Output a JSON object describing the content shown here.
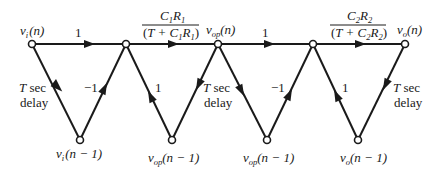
{
  "diagram": {
    "type": "signal-flow-graph",
    "nodes": [
      {
        "id": "vi_n",
        "label": "v_i(n)",
        "v": "v",
        "sub": "i",
        "arg": "(n)",
        "x": 32,
        "y": 44
      },
      {
        "id": "A",
        "label": "",
        "x": 126,
        "y": 44
      },
      {
        "id": "vop_n",
        "label": "v_op(n)",
        "v": "v",
        "sub": "op",
        "arg": "(n)",
        "x": 218,
        "y": 44
      },
      {
        "id": "B",
        "label": "",
        "x": 313,
        "y": 44
      },
      {
        "id": "vo_n",
        "label": "v_o(n)",
        "v": "v",
        "sub": "o",
        "arg": "(n)",
        "x": 405,
        "y": 44
      },
      {
        "id": "vi_n1",
        "label": "v_i(n−1)",
        "v": "v",
        "sub": "i",
        "arg": "(n − 1)",
        "x": 80,
        "y": 140
      },
      {
        "id": "vop_n1a",
        "label": "v_op(n−1)",
        "v": "v",
        "sub": "op",
        "arg": "(n − 1)",
        "x": 172,
        "y": 140
      },
      {
        "id": "vop_n1b",
        "label": "v_op(n−1)",
        "v": "v",
        "sub": "op",
        "arg": "(n − 1)",
        "x": 267,
        "y": 140
      },
      {
        "id": "vo_n1",
        "label": "v_o(n−1)",
        "v": "v",
        "sub": "o",
        "arg": "(n − 1)",
        "x": 358,
        "y": 140
      }
    ],
    "edges": [
      {
        "from": "vi_n",
        "to": "A",
        "gain": "1"
      },
      {
        "from": "A",
        "to": "vop_n",
        "gain": "C1R1/(T + C1R1)"
      },
      {
        "from": "vop_n",
        "to": "B",
        "gain": "1"
      },
      {
        "from": "B",
        "to": "vo_n",
        "gain": "C2R2/(T + C2R2)"
      },
      {
        "from": "vi_n",
        "to": "vi_n1",
        "gain": "T sec delay"
      },
      {
        "from": "vi_n1",
        "to": "A",
        "gain": "−1"
      },
      {
        "from": "vop_n1a",
        "to": "A",
        "gain": "1"
      },
      {
        "from": "vop_n",
        "to": "vop_n1a",
        "gain": "T sec delay"
      },
      {
        "from": "vop_n",
        "to": "vop_n1b",
        "gain": ""
      },
      {
        "from": "vop_n1b",
        "to": "B",
        "gain": "−1"
      },
      {
        "from": "vo_n1",
        "to": "B",
        "gain": "1"
      },
      {
        "from": "vo_n",
        "to": "vo_n1",
        "gain": "T sec delay"
      }
    ]
  },
  "labels": {
    "gain_one": "1",
    "gain_neg_one": "−1",
    "delay_T": "T",
    "delay_sec": " sec",
    "delay_word": "delay",
    "frac1": {
      "num_c": "C",
      "num_c_sub": "1",
      "num_r": "R",
      "num_r_sub": "1",
      "den_open": "(",
      "den_T": "T",
      "den_plus": " + C",
      "den_c_sub": "1",
      "den_r": "R",
      "den_r_sub": "1",
      "den_close": ")"
    },
    "frac2": {
      "num_c": "C",
      "num_c_sub": "2",
      "num_r": "R",
      "num_r_sub": "2",
      "den_open": "(",
      "den_T": "T",
      "den_plus": " + C",
      "den_c_sub": "2",
      "den_r": "R",
      "den_r_sub": "2",
      "den_close": ")"
    },
    "v": "v",
    "sub_i": "i",
    "sub_op": "op",
    "sub_o": "o",
    "arg_n": "(n)",
    "arg_n1": "(n − 1)"
  }
}
